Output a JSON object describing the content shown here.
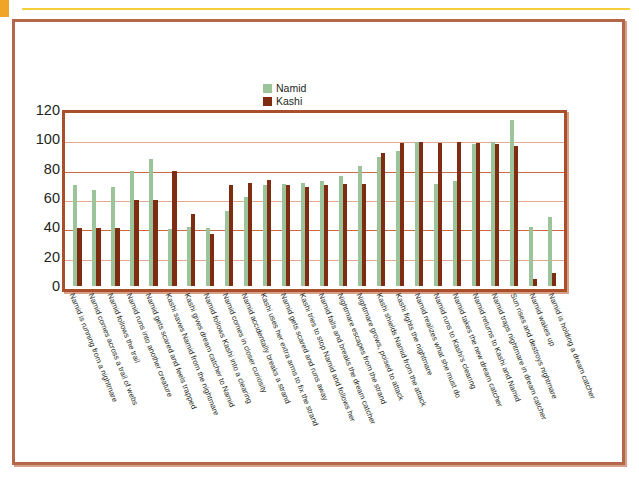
{
  "slide": {
    "accent_top_color": "#f5cf3a",
    "corner_color": "#f0a526",
    "frame_color": "#b4674a",
    "plot_frame_color": "#a94f2c"
  },
  "legend": {
    "position": "top-center",
    "entries": [
      {
        "label": "Namid",
        "color": "#9cc49a"
      },
      {
        "label": "Kashi",
        "color": "#7e2d12"
      }
    ]
  },
  "chart_data": {
    "type": "bar",
    "title": "",
    "subtitle": "",
    "xlabel": "",
    "ylabel": "",
    "ylim": [
      0,
      120
    ],
    "yticks": [
      0,
      20,
      40,
      60,
      80,
      100,
      120
    ],
    "ytick_labels": [
      "0",
      "20",
      "40",
      "60",
      "80",
      "100",
      "120"
    ],
    "grid": true,
    "legend_position": "top-center",
    "categories": [
      "Namid is running from a nightmare",
      "Namid comes across a trail of webs",
      "Namid follows the trail",
      "Namid runs into another creature",
      "Namid gets scared and feels trapped",
      "Kashi saves Namid from the nightmare",
      "Kashi gives dream catcher to Namid",
      "Namid follows Kashi into a clearing",
      "Namid comes in closer curiosity",
      "Namid accidentally breaks a strand",
      "Kashi uses her extra arms to fix the strand",
      "Namid gets scared and runs away",
      "Kashi tries to stop Namid and follows her",
      "Namid falls and breaks the dream catcher",
      "Nightmare escapes from the strand",
      "Nightmare grows, poised to attack",
      "Kashi shields Namid from the attack",
      "Kashi fights the nightmare",
      "Namid realizes what she must do",
      "Namid runs to Kashi's clearing",
      "Namid takes the new dream catcher",
      "Namid returns to Kashi and Namid",
      "Namid traps nightmare in dream catcher",
      "Sun rises and destroys nightmare",
      "Namid wakes up",
      "Namid is holding a dream catcher"
    ],
    "series": [
      {
        "name": "Namid",
        "color": "#9cc49a",
        "values": [
          71,
          68,
          70,
          81,
          90,
          40,
          42,
          41,
          53,
          63,
          71,
          72,
          73,
          74,
          78,
          85,
          91,
          95,
          102,
          72,
          74,
          100,
          102,
          117,
          42,
          49
        ]
      },
      {
        "name": "Kashi",
        "color": "#7e2d12",
        "values": [
          41,
          41,
          41,
          61,
          61,
          81,
          51,
          37,
          71,
          73,
          75,
          71,
          70,
          71,
          72,
          72,
          94,
          101,
          102,
          101,
          102,
          101,
          100,
          99,
          5,
          9
        ]
      }
    ]
  }
}
